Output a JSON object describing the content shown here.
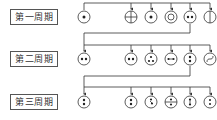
{
  "rows": [
    {
      "label": "第一周期",
      "y": 17,
      "symbols": [
        "dot-center",
        "cross-circle",
        "dot-center",
        "double-circle",
        "two-dots-horizontal",
        "vertical-line"
      ]
    },
    {
      "label": "第二周期",
      "y": 59,
      "symbols": [
        "two-dots-horizontal",
        "two-dots-horizontal",
        "three-dots-triangle",
        "dots-with-dash",
        "two-dots-vertical",
        "s-curve"
      ]
    },
    {
      "label": "第三周期",
      "y": 102,
      "symbols": [
        "two-dots-vertical",
        "two-dots-vertical",
        "dots-with-tail",
        "dots-with-bar",
        "dots-vertical-arrow",
        "two-dots-vertical-small"
      ]
    }
  ],
  "colors": {
    "stroke": "#333333",
    "box_border": "#555555"
  }
}
